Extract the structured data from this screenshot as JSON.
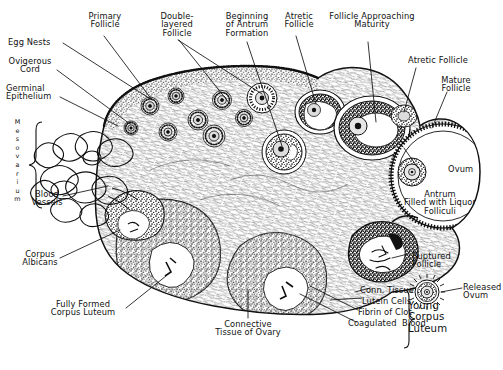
{
  "figure": {
    "ink_color": "#111111",
    "background_color": "#ffffff"
  },
  "labels": {
    "egg_nests": "Egg Nests",
    "ovigerous_cord": "Ovigerous\nCord",
    "germinal_epithelium": "Germinal\nEpithelium",
    "mesovarium": "Mesovarium",
    "blood_vessels": "Blood\nVessels",
    "primary_follicle": "Primary\nFollicle",
    "double_layered_follicle": "Double-\nlayered\nFollicle",
    "beginning_antrum": "Beginning\nof Antrum\nFormation",
    "atretic_follicle_top": "Atretic\nFollicle",
    "follicle_approaching_maturity": "Follicle Approaching\nMaturity",
    "atretic_follicle_right": "Atretic Follicle",
    "mature_follicle": "Mature\nFollicle",
    "ovum": "Ovum",
    "antrum_liquor": "Antrum\nFilled with Liquor\nFolliculi",
    "ruptured_follicle": "Ruptured\nFollicle",
    "released_ovum": "Released\nOvum",
    "young_corpus_luteum": "Young\nCorpus\nLuteum",
    "conn_tissue": "Conn. Tissue",
    "lutein_cells": "Lutein Cells",
    "fibrin_of_clot": "Fibrin of Clot",
    "coagulated_blood": "Coagulated  Blood",
    "connective_tissue_of_ovary": "Connective\nTissue of Ovary",
    "corpus_albicans": "Corpus\nAlbicans",
    "fully_formed_corpus_luteum": "Fully Formed\nCorpus Luteum"
  }
}
